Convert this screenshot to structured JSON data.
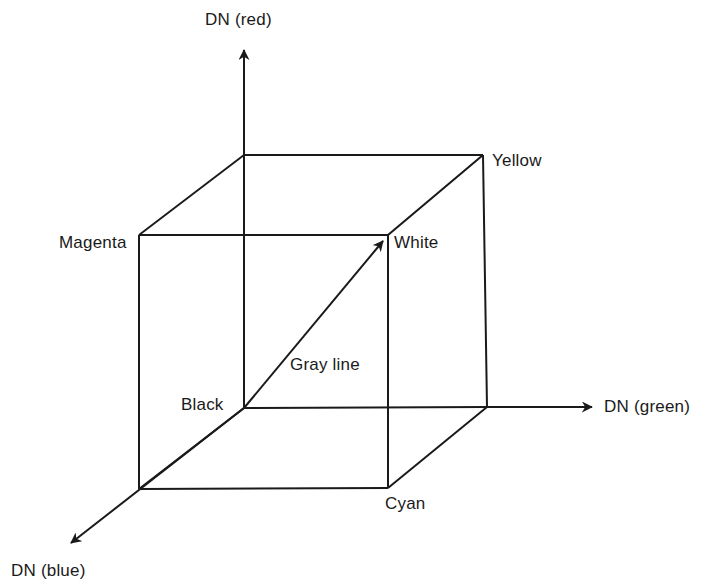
{
  "figure": {
    "kind": "rgb-color-cube-diagram",
    "background_color": "#ffffff",
    "stroke_color": "#1a1a1a",
    "stroke_width": 2
  },
  "axes": [
    {
      "key": "red",
      "label": "DN (red)",
      "direction": "up",
      "origin": [
        244,
        408
      ],
      "arrow_tip": [
        244,
        45
      ]
    },
    {
      "key": "green",
      "label": "DN (green)",
      "direction": "right",
      "origin": [
        244,
        408
      ],
      "arrow_tip": [
        598,
        407
      ]
    },
    {
      "key": "blue",
      "label": "DN (blue)",
      "direction": "down-left",
      "origin": [
        244,
        408
      ],
      "arrow_tip": [
        65,
        548
      ]
    }
  ],
  "vertices": [
    {
      "key": "black",
      "label": "Black",
      "point": [
        244,
        408
      ]
    },
    {
      "key": "white",
      "label": "White",
      "point": [
        388,
        235
      ]
    },
    {
      "key": "magenta",
      "label": "Magenta",
      "point": [
        139,
        235
      ]
    },
    {
      "key": "yellow",
      "label": "Yellow",
      "point": [
        483,
        155
      ]
    },
    {
      "key": "cyan",
      "label": "Cyan",
      "point": [
        388,
        488
      ]
    }
  ],
  "unlabeled_vertices": [
    {
      "key": "red-top-back",
      "point": [
        244,
        155
      ]
    },
    {
      "key": "green-right-back",
      "point": [
        487,
        407
      ]
    },
    {
      "key": "blue-front-left",
      "point": [
        139,
        489
      ]
    }
  ],
  "gray_line": {
    "label": "Gray line",
    "from": [
      244,
      408
    ],
    "to": [
      388,
      235
    ],
    "has_arrowhead": true
  },
  "labels": {
    "axis_red": "DN (red)",
    "axis_green": "DN (green)",
    "axis_blue": "DN (blue)",
    "vertex_black": "Black",
    "vertex_white": "White",
    "vertex_magenta": "Magenta",
    "vertex_yellow": "Yellow",
    "vertex_cyan": "Cyan",
    "gray_line": "Gray line"
  }
}
